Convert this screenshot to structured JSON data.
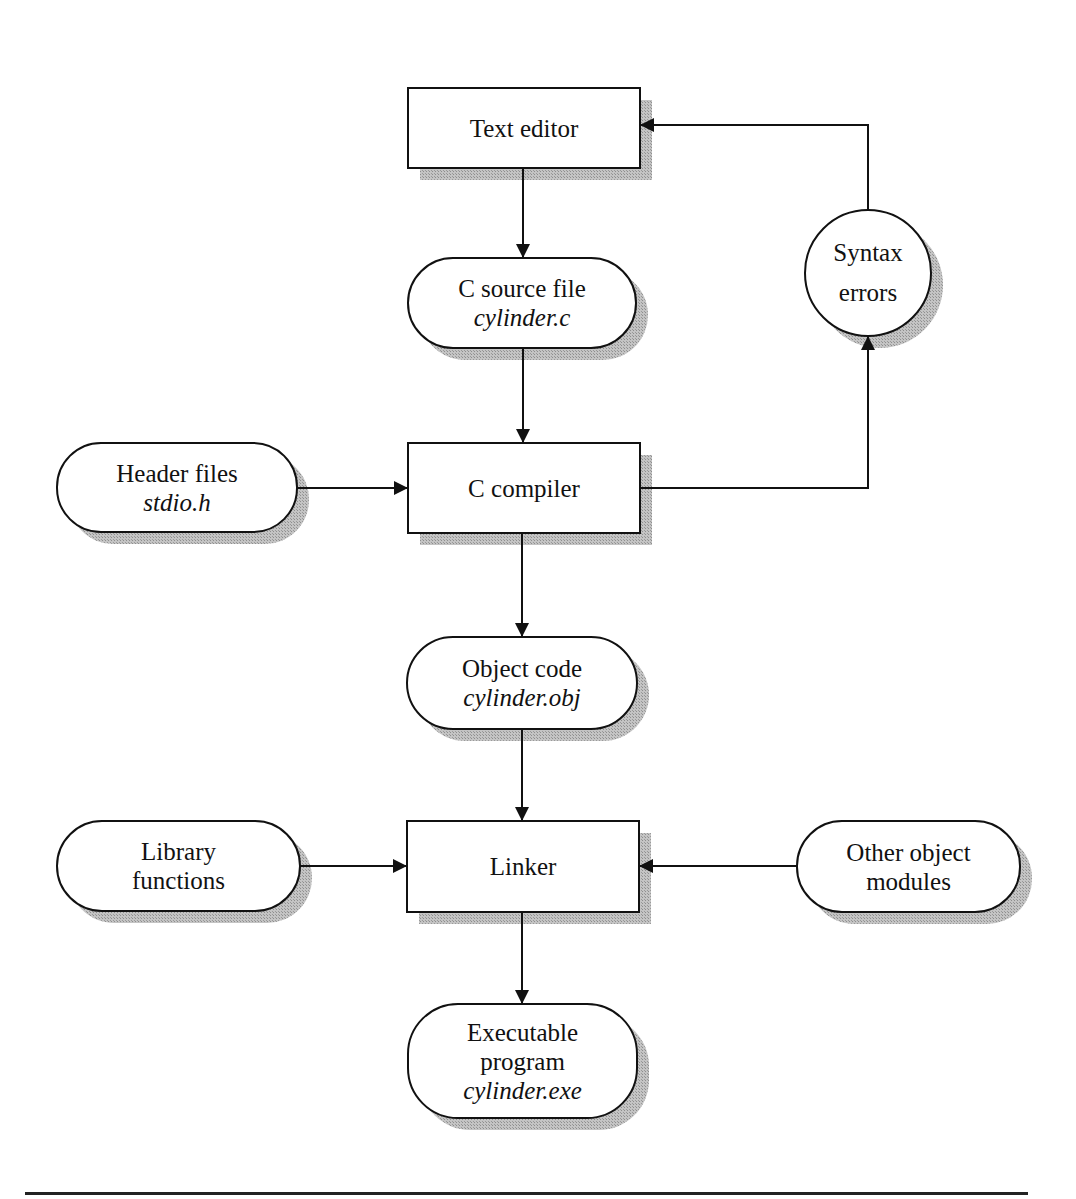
{
  "diagram": {
    "type": "flowchart",
    "nodes": {
      "text_editor": {
        "label": "Text editor",
        "shape": "rectangle"
      },
      "c_source_file": {
        "label": "C source file",
        "sub": "cylinder.c",
        "shape": "terminal"
      },
      "syntax_errors": {
        "line1": "Syntax",
        "line2": "errors",
        "shape": "circle"
      },
      "header_files": {
        "label": "Header files",
        "sub": "stdio.h",
        "shape": "terminal"
      },
      "c_compiler": {
        "label": "C compiler",
        "shape": "rectangle"
      },
      "object_code": {
        "label": "Object code",
        "sub": "cylinder.obj",
        "shape": "terminal"
      },
      "library_functions": {
        "line1": "Library",
        "line2": "functions",
        "shape": "terminal"
      },
      "linker": {
        "label": "Linker",
        "shape": "rectangle"
      },
      "other_object_modules": {
        "line1": "Other object",
        "line2": "modules",
        "shape": "terminal"
      },
      "executable_program": {
        "line1": "Executable",
        "line2": "program",
        "sub": "cylinder.exe",
        "shape": "terminal"
      }
    },
    "edges": [
      {
        "from": "Text editor",
        "to": "C source file"
      },
      {
        "from": "C source file",
        "to": "C compiler"
      },
      {
        "from": "Header files",
        "to": "C compiler"
      },
      {
        "from": "C compiler",
        "to": "Syntax errors"
      },
      {
        "from": "Syntax errors",
        "to": "Text editor"
      },
      {
        "from": "C compiler",
        "to": "Object code"
      },
      {
        "from": "Object code",
        "to": "Linker"
      },
      {
        "from": "Library functions",
        "to": "Linker"
      },
      {
        "from": "Other object modules",
        "to": "Linker"
      },
      {
        "from": "Linker",
        "to": "Executable program"
      }
    ],
    "colors": {
      "line": "#111111",
      "shadow": "#b8b8b8",
      "fill": "#ffffff"
    }
  }
}
